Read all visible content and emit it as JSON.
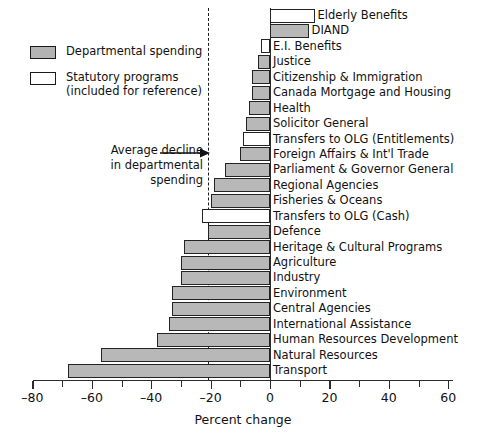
{
  "legend": {
    "items": [
      {
        "label": "Departmental spending",
        "swatch": "dept",
        "sublabel": ""
      },
      {
        "label": "Statutory programs",
        "swatch": "stat",
        "sublabel": "(included for reference)"
      }
    ]
  },
  "annotation": {
    "line1": "Average decline",
    "line2": "in departmental",
    "line3": "spending",
    "value": -21,
    "arrow_icon": "right-arrow-icon"
  },
  "axis": {
    "xlabel": "Percent change",
    "tick_labels": [
      "–80",
      "–60",
      "–40",
      "–20",
      "0",
      "20",
      "40",
      "60"
    ],
    "tick_values": [
      -80,
      -60,
      -40,
      -20,
      0,
      20,
      40,
      60
    ],
    "minor_step": 10
  },
  "colors": {
    "departmental_fill": "#b8b8b8",
    "statutory_fill": "#ffffff",
    "outline": "#232323",
    "axis": "#2b2b2b",
    "background": "#ffffff"
  },
  "chart_data": {
    "type": "bar",
    "orientation": "horizontal",
    "title": "",
    "subtitle": "",
    "xlabel": "Percent change",
    "ylabel": "",
    "xlim": [
      -80,
      65
    ],
    "grid": false,
    "legend_position": "top-left",
    "reference_line": {
      "label": "Average decline in departmental spending",
      "value": -21,
      "style": "dashed"
    },
    "categories": [
      "Elderly Benefits",
      "DIAND",
      "E.I. Benefits",
      "Justice",
      "Citizenship & Immigration",
      "Canada Mortgage and Housing",
      "Health",
      "Solicitor General",
      "Transfers to OLG (Entitlements)",
      "Foreign Affairs & Int'l Trade",
      "Parliament & Governor General",
      "Regional Agencies",
      "Fisheries & Oceans",
      "Transfers to OLG (Cash)",
      "Defence",
      "Heritage & Cultural Programs",
      "Agriculture",
      "Industry",
      "Environment",
      "Central Agencies",
      "International Assistance",
      "Human Resources Development",
      "Natural Resources",
      "Transport"
    ],
    "values": [
      15,
      13,
      -3,
      -4,
      -6,
      -6,
      -7,
      -8,
      -9,
      -10,
      -15,
      -19,
      -20,
      -23,
      -21,
      -29,
      -30,
      -30,
      -33,
      -33,
      -34,
      -38,
      -57,
      -68
    ],
    "series_types": [
      "statutory",
      "departmental",
      "statutory",
      "departmental",
      "departmental",
      "departmental",
      "departmental",
      "departmental",
      "statutory",
      "departmental",
      "departmental",
      "departmental",
      "departmental",
      "statutory",
      "departmental",
      "departmental",
      "departmental",
      "departmental",
      "departmental",
      "departmental",
      "departmental",
      "departmental",
      "departmental",
      "departmental"
    ],
    "label_side": [
      "outside-right",
      "inside-right",
      "outside-right",
      "outside-right",
      "outside-right",
      "outside-right",
      "outside-right",
      "outside-right",
      "outside-right",
      "outside-right",
      "outside-right",
      "outside-right",
      "outside-right",
      "outside-right",
      "outside-right",
      "outside-right",
      "outside-right",
      "outside-right",
      "outside-right",
      "outside-right",
      "outside-right",
      "outside-right",
      "outside-right",
      "outside-right"
    ]
  }
}
